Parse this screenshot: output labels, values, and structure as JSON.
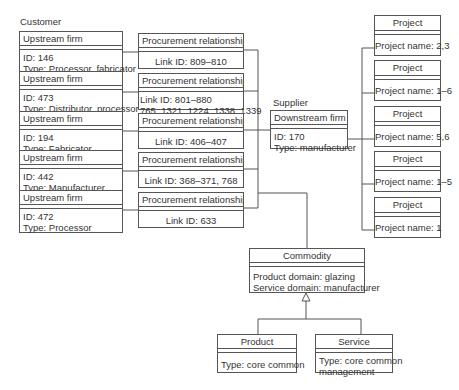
{
  "labels": {
    "customer": "Customer",
    "supplier": "Supplier"
  },
  "upstream_firms": [
    {
      "header": "Upstream firm",
      "id": "ID: 146",
      "type": "Type: Processor, fabricator"
    },
    {
      "header": "Upstream firm",
      "id": "ID: 473",
      "type": "Type: Distributor, processor"
    },
    {
      "header": "Upstream firm",
      "id": "ID: 194",
      "type": "Type: Fabricator"
    },
    {
      "header": "Upstream firm",
      "id": "ID: 442",
      "type": "Type: Manufacturer"
    },
    {
      "header": "Upstream firm",
      "id": "ID: 472",
      "type": "Type: Processor"
    }
  ],
  "procurement_relationships": [
    {
      "header": "Procurement relationship",
      "line1": "Link ID: 809–810",
      "line2": ""
    },
    {
      "header": "Procurement relationship",
      "line1": "Link ID: 801–880",
      "line2": "765, 1321, 1224, 1338, 1339"
    },
    {
      "header": "Procurement relationship",
      "line1": "Link ID: 406–407",
      "line2": ""
    },
    {
      "header": "Procurement relationship",
      "line1": "Link ID: 368–371, 768",
      "line2": ""
    },
    {
      "header": "Procurement relationship",
      "line1": "Link ID: 633",
      "line2": ""
    }
  ],
  "downstream_firm": {
    "header": "Downstream firm",
    "id": "ID: 170",
    "type": "Type: manufacturer"
  },
  "projects": [
    {
      "header": "Project",
      "name": "Project name: 2,3"
    },
    {
      "header": "Project",
      "name": "Project name: 1–6"
    },
    {
      "header": "Project",
      "name": "Project name: 5,6"
    },
    {
      "header": "Project",
      "name": "Project name: 1–5"
    },
    {
      "header": "Project",
      "name": "Project name: 1"
    }
  ],
  "commodity": {
    "header": "Commodity",
    "line1": "Product domain: glazing",
    "line2": "Service domain: manufacturer"
  },
  "product": {
    "header": "Product",
    "line1": "Type: core common"
  },
  "service": {
    "header": "Service",
    "line1": "Type: core common",
    "line2": "management"
  },
  "colors": {
    "line": "#555555",
    "text": "#333333",
    "background": "#ffffff"
  }
}
